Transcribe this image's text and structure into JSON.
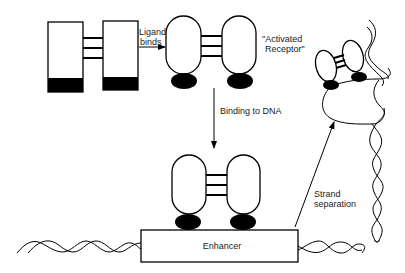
{
  "diagram": {
    "colors": {
      "line": "#000000",
      "fill": "#ffffff",
      "text": "#222222"
    },
    "labels": {
      "ligand_binds_line1": "Ligand",
      "ligand_binds_line2": "binds",
      "activated_line1": "\"Activated",
      "activated_line2": "Receptor\"",
      "binding_to_dna": "Binding to DNA",
      "enhancer": "Enhancer",
      "strand_line1": "Strand",
      "strand_line2": "separation"
    },
    "nodes": [
      {
        "id": "inactive-receptor",
        "shape": "two rectangles with black bases joined by 3 bars"
      },
      {
        "id": "activated-receptor",
        "shape": "two ovals with black feet joined by 3 bars"
      },
      {
        "id": "dna-bound-receptor",
        "shape": "two ovals with black feet on enhancer"
      },
      {
        "id": "enhancer",
        "shape": "rectangle on DNA helix"
      },
      {
        "id": "separated-strand-receptor",
        "shape": "tilted receptor on open DNA loop"
      }
    ],
    "edges": [
      {
        "from": "inactive-receptor",
        "to": "activated-receptor",
        "label": "Ligand binds"
      },
      {
        "from": "activated-receptor",
        "to": "dna-bound-receptor",
        "label": "Binding to DNA"
      },
      {
        "from": "enhancer",
        "to": "separated-strand-receptor",
        "label": "Strand separation"
      }
    ]
  }
}
